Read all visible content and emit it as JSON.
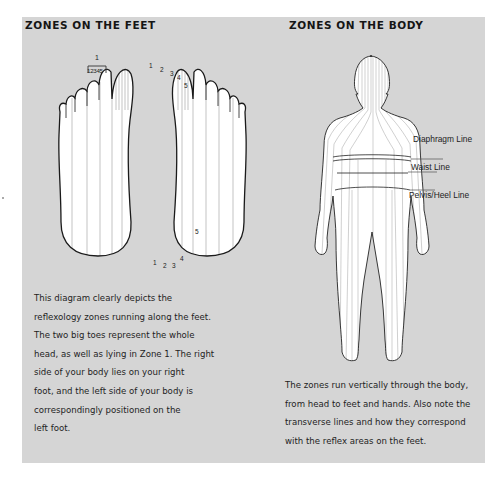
{
  "feet_section": {
    "title": "ZONES ON THE FEET",
    "bracket_label": "1",
    "bracket_sub_label": "12345",
    "right_foot_toe_numbers": [
      "1",
      "2",
      "3",
      "4",
      "5"
    ],
    "right_foot_heel_numbers": [
      "1",
      "2",
      "3",
      "4",
      "5"
    ],
    "description_lines": [
      "This diagram clearly depicts the",
      "reflexology zones running along the feet.",
      "The two big toes represent the whole",
      "head, as well as lying in Zone 1. The right",
      "side of your body lies on your right",
      "foot, and the left side of your body is",
      "correspondingly positioned on the",
      "left foot."
    ]
  },
  "body_section": {
    "title": "ZONES ON THE BODY",
    "callouts": {
      "diaphragm": "Diaphragm Line",
      "waist": "Waist Line",
      "pelvis": "Pelvis/Heel Line"
    },
    "description_lines": [
      "The zones run vertically through the body,",
      "from head to feet and hands. Also note the",
      "transverse lines and how they correspond",
      "with the reflex areas on the feet."
    ]
  },
  "colors": {
    "panel_background": "#d5d5d5",
    "outline": "#1a1a1a",
    "zone_lines": "#9a9a9a"
  }
}
